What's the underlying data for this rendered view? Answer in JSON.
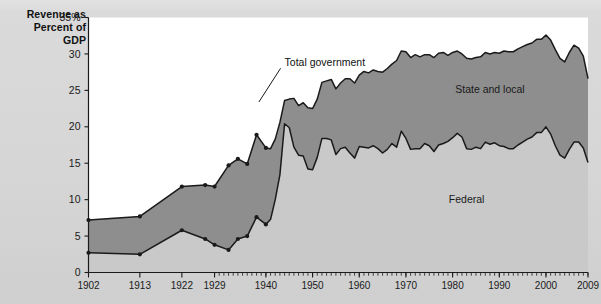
{
  "axis_title": "Revenue as\nPercent of\nGDP",
  "axis_title_lines": [
    "Revenue as",
    "Percent of",
    "GDP"
  ],
  "labels": {
    "total_government": "Total government",
    "state_and_local": "State and local",
    "federal": "Federal"
  },
  "colors": {
    "page_background": "#d8d8d8",
    "plot_background": "#ffffff",
    "state_local_band": "#8e8e8e",
    "federal_band": "#c9c9c9",
    "line": "#1a1a1a",
    "text": "#111111"
  },
  "chart_data": {
    "type": "area",
    "title": "",
    "subtitle": "",
    "xlabel": "",
    "ylabel": "Revenue as Percent of GDP",
    "ylim": [
      0,
      35
    ],
    "yticks": [
      0,
      5,
      10,
      15,
      20,
      25,
      30,
      35
    ],
    "ytick_labels": [
      "0",
      "5",
      "10",
      "15",
      "20",
      "25",
      "30",
      "35%"
    ],
    "xlim": [
      1902,
      2009
    ],
    "xticks": [
      1902,
      1913,
      1922,
      1929,
      1940,
      1950,
      1960,
      1970,
      1980,
      1990,
      2000,
      2009
    ],
    "xtick_labels": [
      "1902",
      "1913",
      "1922",
      "1929",
      "1940",
      "1950",
      "1960",
      "1970",
      "1980",
      "1990",
      "2000",
      "2009"
    ],
    "minor_tick_interval": 1,
    "minor_ticks_start": 1929,
    "grid": false,
    "legend": "inline-annotations",
    "annotations": [
      {
        "text": "Total government",
        "x": 1944,
        "y": 28.3,
        "leader_to_x": 1938.5,
        "leader_to_y": 23.4
      },
      {
        "text": "State and local",
        "x": 1988,
        "y": 24.6
      },
      {
        "text": "Federal",
        "x": 1983,
        "y": 9.6
      }
    ],
    "stacking": "federal bottom, state-and-local stacked above; upper boundary = total government",
    "marked_points_years": [
      1902,
      1913,
      1922,
      1927,
      1929,
      1932,
      1934,
      1936,
      1938,
      1940
    ],
    "series": [
      {
        "name": "Federal",
        "years": [
          1902,
          1913,
          1922,
          1927,
          1929,
          1932,
          1934,
          1936,
          1938,
          1940,
          1941,
          1942,
          1943,
          1944,
          1945,
          1946,
          1947,
          1948,
          1949,
          1950,
          1951,
          1952,
          1953,
          1954,
          1955,
          1956,
          1957,
          1958,
          1959,
          1960,
          1961,
          1962,
          1963,
          1964,
          1965,
          1966,
          1967,
          1968,
          1969,
          1970,
          1971,
          1972,
          1973,
          1974,
          1975,
          1976,
          1977,
          1978,
          1979,
          1980,
          1981,
          1982,
          1983,
          1984,
          1985,
          1986,
          1987,
          1988,
          1989,
          1990,
          1991,
          1992,
          1993,
          1994,
          1995,
          1996,
          1997,
          1998,
          1999,
          2000,
          2001,
          2002,
          2003,
          2004,
          2005,
          2006,
          2007,
          2008,
          2009
        ],
        "values": [
          2.7,
          2.5,
          5.8,
          4.6,
          3.8,
          3.1,
          4.6,
          5.0,
          7.6,
          6.6,
          7.3,
          10.0,
          13.4,
          20.4,
          19.9,
          17.2,
          16.1,
          16.0,
          14.2,
          14.1,
          15.8,
          18.4,
          18.4,
          18.2,
          16.2,
          17.0,
          17.2,
          16.4,
          15.7,
          17.3,
          17.2,
          17.1,
          17.4,
          17.0,
          16.4,
          16.9,
          17.7,
          17.2,
          19.4,
          18.4,
          16.9,
          17.0,
          17.0,
          17.7,
          17.4,
          16.6,
          17.5,
          17.7,
          18.0,
          18.5,
          19.1,
          18.6,
          17.0,
          16.9,
          17.2,
          17.0,
          17.9,
          17.6,
          17.8,
          17.4,
          17.3,
          17.0,
          17.0,
          17.5,
          17.9,
          18.3,
          18.6,
          19.2,
          19.2,
          20.0,
          19.0,
          17.4,
          16.1,
          15.7,
          16.9,
          17.9,
          17.9,
          17.1,
          15.1
        ]
      },
      {
        "name": "State and local",
        "years": [
          1902,
          1913,
          1922,
          1927,
          1929,
          1932,
          1934,
          1936,
          1938,
          1940,
          1941,
          1942,
          1943,
          1944,
          1945,
          1946,
          1947,
          1948,
          1949,
          1950,
          1951,
          1952,
          1953,
          1954,
          1955,
          1956,
          1957,
          1958,
          1959,
          1960,
          1961,
          1962,
          1963,
          1964,
          1965,
          1966,
          1967,
          1968,
          1969,
          1970,
          1971,
          1972,
          1973,
          1974,
          1975,
          1976,
          1977,
          1978,
          1979,
          1980,
          1981,
          1982,
          1983,
          1984,
          1985,
          1986,
          1987,
          1988,
          1989,
          1990,
          1991,
          1992,
          1993,
          1994,
          1995,
          1996,
          1997,
          1998,
          1999,
          2000,
          2001,
          2002,
          2003,
          2004,
          2005,
          2006,
          2007,
          2008,
          2009
        ],
        "values": [
          4.5,
          5.2,
          6.0,
          7.4,
          8.0,
          11.6,
          11.0,
          9.9,
          11.3,
          10.5,
          9.7,
          8.3,
          7.2,
          3.2,
          3.9,
          6.7,
          6.8,
          7.3,
          8.4,
          8.4,
          8.0,
          7.7,
          7.9,
          8.3,
          9.0,
          9.0,
          9.4,
          10.2,
          10.3,
          9.8,
          10.4,
          10.3,
          10.4,
          10.6,
          11.1,
          11.1,
          10.9,
          11.9,
          11.0,
          11.9,
          12.6,
          12.9,
          12.6,
          12.2,
          12.5,
          12.9,
          12.6,
          12.5,
          11.8,
          11.7,
          11.3,
          11.4,
          12.4,
          12.4,
          12.3,
          12.6,
          12.3,
          12.4,
          12.4,
          12.7,
          13.1,
          13.3,
          13.3,
          13.2,
          13.1,
          13.0,
          12.9,
          12.8,
          12.8,
          12.6,
          12.9,
          13.2,
          13.3,
          13.2,
          13.3,
          13.3,
          12.9,
          12.6,
          11.5
        ]
      },
      {
        "name": "Total government",
        "years": [
          1902,
          1913,
          1922,
          1927,
          1929,
          1932,
          1934,
          1936,
          1938,
          1940,
          1941,
          1942,
          1943,
          1944,
          1945,
          1946,
          1947,
          1948,
          1949,
          1950,
          1951,
          1952,
          1953,
          1954,
          1955,
          1956,
          1957,
          1958,
          1959,
          1960,
          1961,
          1962,
          1963,
          1964,
          1965,
          1966,
          1967,
          1968,
          1969,
          1970,
          1971,
          1972,
          1973,
          1974,
          1975,
          1976,
          1977,
          1978,
          1979,
          1980,
          1981,
          1982,
          1983,
          1984,
          1985,
          1986,
          1987,
          1988,
          1989,
          1990,
          1991,
          1992,
          1993,
          1994,
          1995,
          1996,
          1997,
          1998,
          1999,
          2000,
          2001,
          2002,
          2003,
          2004,
          2005,
          2006,
          2007,
          2008,
          2009
        ],
        "values": [
          7.2,
          7.7,
          11.8,
          12.0,
          11.8,
          14.7,
          15.6,
          14.9,
          18.9,
          17.1,
          17.0,
          18.3,
          20.6,
          23.6,
          23.8,
          23.9,
          22.9,
          23.3,
          22.6,
          22.5,
          23.8,
          26.1,
          26.3,
          26.5,
          25.2,
          26.0,
          26.6,
          26.6,
          26.0,
          27.1,
          27.6,
          27.4,
          27.8,
          27.6,
          27.5,
          28.0,
          28.6,
          29.1,
          30.4,
          30.3,
          29.5,
          29.9,
          29.6,
          29.9,
          29.9,
          29.5,
          30.1,
          30.2,
          29.8,
          30.2,
          30.4,
          30.0,
          29.4,
          29.3,
          29.5,
          29.6,
          30.2,
          30.0,
          30.2,
          30.1,
          30.4,
          30.3,
          30.3,
          30.7,
          31.0,
          31.3,
          31.5,
          32.0,
          32.0,
          32.6,
          31.9,
          30.6,
          29.4,
          28.9,
          30.2,
          31.2,
          30.8,
          29.7,
          26.6
        ]
      }
    ]
  }
}
